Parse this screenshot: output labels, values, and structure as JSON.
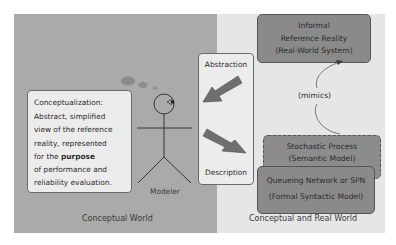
{
  "panels": {
    "left": {
      "label": "Conceptual World",
      "color": "#aaaaaa"
    },
    "right": {
      "label": "Conceptual and Real World",
      "color": "#e6e6e6"
    }
  },
  "conceptualization": {
    "title": "Conceptualization:",
    "lines": [
      "Abstract, simplified",
      "view of the reference",
      "reality, represented",
      "for the",
      "of performance and",
      "reliability evaluation."
    ],
    "bold_word": "purpose"
  },
  "modeler": {
    "label": "Modeler",
    "thought_bubble_icon": "thought-bubble-icon",
    "figure_icon": "stick-figure-icon"
  },
  "transform_box": {
    "top_label": "Abstraction",
    "bottom_label": "Description",
    "arrow_color": "#6f6f6f"
  },
  "reality_box": {
    "lines": [
      "Informal",
      "Reference Reality",
      "(Real-World System)"
    ]
  },
  "relation": {
    "label": "(mimics)"
  },
  "semantic_box": {
    "lines": [
      "Stochastic Process",
      "(Semantic Model)"
    ]
  },
  "syntactic_box": {
    "lines": [
      "Queueing Network or SPN",
      "(Formal Syntactic Model)"
    ]
  },
  "colors": {
    "model_box": "#8a8a8a",
    "text_box": "#ececec",
    "border": "#555555"
  }
}
